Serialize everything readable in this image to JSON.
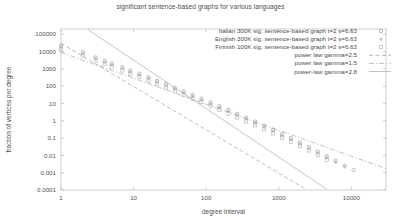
{
  "chart_data": {
    "type": "scatter",
    "title": "significant sentence-based graphs for various languages",
    "xlabel": "degree interval",
    "ylabel": "fraction of vertices per degree",
    "xscale": "log",
    "yscale": "log",
    "xlim": [
      1,
      30000
    ],
    "ylim": [
      0.0001,
      200000
    ],
    "xticks": [
      "1",
      "10",
      "100",
      "1000",
      "10000"
    ],
    "xtick_values": [
      1,
      10,
      100,
      1000,
      10000
    ],
    "yticks": [
      "100000",
      "10000",
      "1000",
      "100",
      "10",
      "1",
      "0.1",
      "0.01",
      "0.001",
      "0.0001"
    ],
    "ytick_values": [
      100000,
      10000,
      1000,
      100,
      10,
      1,
      0.1,
      0.01,
      0.001,
      0.0001
    ],
    "grid": false,
    "legend_position": "top-right",
    "series": [
      {
        "name": "Italian 300K sig. sentence-based graph t=2 s=6.63",
        "marker": "circle",
        "color": "#9a9a9a",
        "points": [
          [
            1,
            21000
          ],
          [
            2,
            9000
          ],
          [
            3,
            4600
          ],
          [
            4,
            2900
          ],
          [
            5,
            2000
          ],
          [
            7,
            1250
          ],
          [
            9,
            800
          ],
          [
            12,
            520
          ],
          [
            16,
            330
          ],
          [
            21,
            200
          ],
          [
            28,
            130
          ],
          [
            37,
            80
          ],
          [
            49,
            50
          ],
          [
            65,
            31
          ],
          [
            86,
            19
          ],
          [
            115,
            11.5
          ],
          [
            152,
            7.0
          ],
          [
            202,
            4.2
          ],
          [
            268,
            2.5
          ],
          [
            356,
            1.5
          ],
          [
            473,
            0.9
          ],
          [
            628,
            0.52
          ],
          [
            834,
            0.3
          ],
          [
            1108,
            0.17
          ],
          [
            1471,
            0.1
          ],
          [
            1954,
            0.055
          ],
          [
            2595,
            0.03
          ],
          [
            3447,
            0.017
          ],
          [
            4578,
            0.009
          ],
          [
            6080,
            0.005
          ],
          [
            8075,
            0.0026
          ],
          [
            10724,
            0.0014
          ]
        ]
      },
      {
        "name": "English 300K sig. sentence-based graph t=2 s=6.63",
        "marker": "plus",
        "color": "#a8a8a8",
        "points": [
          [
            1,
            17000
          ],
          [
            2,
            7600
          ],
          [
            3,
            3900
          ],
          [
            4,
            2400
          ],
          [
            5,
            1700
          ],
          [
            7,
            1050
          ],
          [
            9,
            680
          ],
          [
            12,
            440
          ],
          [
            16,
            280
          ],
          [
            21,
            172
          ],
          [
            28,
            108
          ],
          [
            37,
            67
          ],
          [
            49,
            42
          ],
          [
            65,
            26
          ],
          [
            86,
            16
          ],
          [
            115,
            9.6
          ],
          [
            152,
            5.8
          ],
          [
            202,
            3.5
          ],
          [
            268,
            2.1
          ],
          [
            356,
            1.25
          ],
          [
            473,
            0.74
          ],
          [
            628,
            0.43
          ],
          [
            834,
            0.25
          ],
          [
            1108,
            0.14
          ],
          [
            1471,
            0.082
          ],
          [
            1954,
            0.046
          ],
          [
            2595,
            0.025
          ],
          [
            3447,
            0.014
          ],
          [
            4578,
            0.0075
          ],
          [
            6080,
            0.0041
          ],
          [
            8075,
            0.0022
          ]
        ]
      },
      {
        "name": "Finnish 100K sig. sentence-based graph t=2 s=6.63",
        "marker": "square",
        "color": "#b5b5b5",
        "points": [
          [
            1,
            13000
          ],
          [
            2,
            5800
          ],
          [
            3,
            3000
          ],
          [
            4,
            1850
          ],
          [
            5,
            1300
          ],
          [
            7,
            800
          ],
          [
            9,
            520
          ],
          [
            12,
            335
          ],
          [
            16,
            210
          ],
          [
            21,
            130
          ],
          [
            28,
            82
          ],
          [
            37,
            50
          ],
          [
            49,
            31
          ],
          [
            65,
            19
          ],
          [
            86,
            11.8
          ],
          [
            115,
            7.1
          ],
          [
            152,
            4.3
          ],
          [
            202,
            2.6
          ],
          [
            268,
            1.55
          ],
          [
            356,
            0.92
          ],
          [
            473,
            0.55
          ],
          [
            628,
            0.32
          ],
          [
            834,
            0.185
          ],
          [
            1108,
            0.105
          ],
          [
            1471,
            0.06
          ],
          [
            1954,
            0.034
          ],
          [
            2595,
            0.019
          ],
          [
            3447,
            0.0105
          ],
          [
            4578,
            0.0056
          ]
        ]
      }
    ],
    "fit_lines": [
      {
        "name": "power law gamma=2.5",
        "gamma": 2.5,
        "style": "dashed",
        "color": "#9f9f9f",
        "anchor": [
          1,
          30000
        ]
      },
      {
        "name": "power law gamma=1.5",
        "gamma": 1.5,
        "style": "dashdot",
        "color": "#a5a5a5",
        "anchor": [
          1,
          9000
        ]
      },
      {
        "name": "power-law gamma=2.8",
        "gamma": 2.8,
        "style": "solid",
        "color": "#aaaaaa",
        "anchor": [
          1,
          2000000
        ]
      }
    ]
  },
  "legend": {
    "entries": [
      {
        "label": "Italian 300K sig. sentence-based graph t=2 s=6.63"
      },
      {
        "label": "English 300K sig. sentence-based graph t=2 s=6.63"
      },
      {
        "label": "Finnish 100K sig. sentence-based graph t=2 s=6.63"
      },
      {
        "label": "power law gamma=2.5"
      },
      {
        "label": "power law gamma=1.5"
      },
      {
        "label": "power-law gamma=2.8"
      }
    ]
  }
}
